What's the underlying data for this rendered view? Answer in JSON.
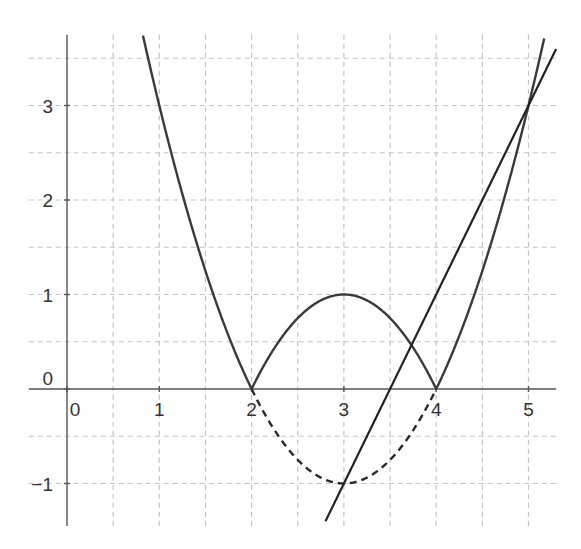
{
  "chart_data": {
    "type": "line",
    "title": "",
    "xlabel": "",
    "ylabel": "",
    "xlim": [
      -0.35,
      5.3
    ],
    "ylim": [
      -1.45,
      3.75
    ],
    "grid": true,
    "grid_step": 0.5,
    "x_ticks": [
      0,
      1,
      2,
      3,
      4,
      5
    ],
    "x_tick_labels": [
      "0",
      "1",
      "2",
      "3",
      "4",
      "5"
    ],
    "y_ticks": [
      -1,
      0,
      1,
      2,
      3
    ],
    "y_tick_labels": [
      "−1",
      "0",
      "1",
      "2",
      "3"
    ],
    "series": [
      {
        "name": "y = |x² − 6x + 8|",
        "style": "solid",
        "expression": "abs((x-2)*(x-4))",
        "x_range": [
          0.8,
          5.4
        ],
        "sample_points": [
          [
            0.8,
            3.84
          ],
          [
            1,
            3
          ],
          [
            2,
            0
          ],
          [
            3,
            1
          ],
          [
            4,
            0
          ],
          [
            5,
            3
          ],
          [
            5.2,
            3.84
          ]
        ]
      },
      {
        "name": "y = x² − 6x + 8 (reflected part)",
        "style": "dashed",
        "expression": "(x-2)*(x-4)",
        "x_range": [
          2,
          4
        ],
        "sample_points": [
          [
            2,
            0
          ],
          [
            3,
            -1
          ],
          [
            4,
            0
          ]
        ]
      },
      {
        "name": "y = 2x − 7",
        "style": "solid",
        "expression": "2*x-7",
        "x_range": [
          2.8,
          5.35
        ],
        "sample_points": [
          [
            2.8,
            -1.4
          ],
          [
            3,
            -1
          ],
          [
            3.5,
            0
          ],
          [
            5,
            3
          ]
        ]
      }
    ],
    "legend": "none"
  }
}
